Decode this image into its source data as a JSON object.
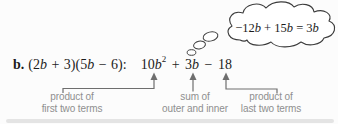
{
  "expression": {
    "item_label": "b.",
    "factored": [
      "(2",
      "b",
      " + 3)(5",
      "b",
      " − 6):"
    ],
    "product": [
      "10",
      "b",
      "2",
      " + ",
      "3",
      "b",
      " − ",
      "18"
    ]
  },
  "thought_bubble": {
    "text": [
      "−12",
      "b",
      " + 15",
      "b",
      " = 3",
      "b"
    ]
  },
  "annotations": {
    "first": {
      "line1": "product of",
      "line2": "first two terms"
    },
    "middle": {
      "line1": "sum of",
      "line2": "outer and inner"
    },
    "last": {
      "line1": "product of",
      "line2": "last two terms"
    }
  },
  "colors": {
    "math_text": "#1c1c1c",
    "annotation_text": "#8f8f8f",
    "connector_line": "#6e6e6e",
    "cloud_outline": "#3c3c3c",
    "background": "#fcfcfc"
  }
}
